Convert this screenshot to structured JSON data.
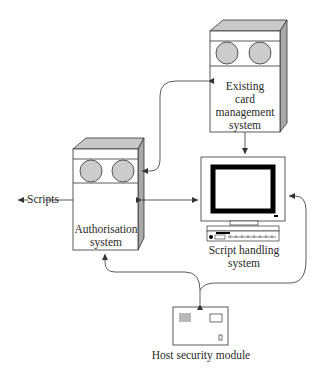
{
  "diagram": {
    "nodes": {
      "card_mgmt": {
        "label_lines": [
          "Existing",
          "card",
          "management",
          "system"
        ],
        "shape": "server-cabinet"
      },
      "authorisation": {
        "label_lines": [
          "Authorisation",
          "system"
        ],
        "shape": "server-cabinet"
      },
      "script_handling": {
        "label_lines": [
          "Script handling",
          "system"
        ],
        "shape": "computer-terminal"
      },
      "hsm": {
        "label": "Host security module",
        "shape": "hardware-module"
      }
    },
    "external_output": {
      "label": "Scripts"
    },
    "edges": [
      {
        "from": "card_mgmt",
        "to": "authorisation",
        "direction": "bidirectional"
      },
      {
        "from": "card_mgmt",
        "to": "script_handling",
        "direction": "one-way"
      },
      {
        "from": "authorisation",
        "to": "script_handling",
        "direction": "bidirectional"
      },
      {
        "from": "authorisation",
        "to": "scripts",
        "direction": "one-way"
      },
      {
        "from": "hsm",
        "to": "authorisation",
        "direction": "bidirectional"
      },
      {
        "from": "hsm",
        "to": "script_handling",
        "direction": "bidirectional"
      }
    ],
    "colors": {
      "stroke": "#333333",
      "top_face": "#c8c8c8",
      "side_face": "#a8a8a8",
      "disk": "#cccccc",
      "screen_border": "#000000"
    }
  }
}
